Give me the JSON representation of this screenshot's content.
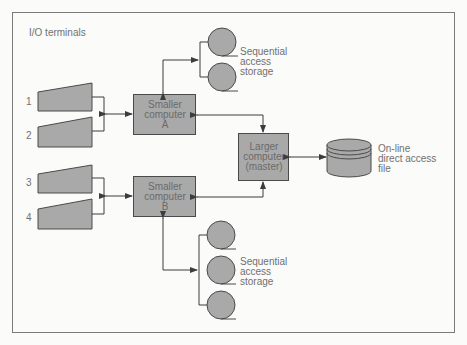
{
  "title": "I/O terminals",
  "terminals": [
    {
      "id": "1",
      "label": "1"
    },
    {
      "id": "2",
      "label": "2"
    },
    {
      "id": "3",
      "label": "3"
    },
    {
      "id": "4",
      "label": "4"
    }
  ],
  "computers": {
    "smaller_a": {
      "label": "Smaller\ncomputer\nA"
    },
    "smaller_b": {
      "label": "Smaller\ncomputer\nB"
    },
    "larger": {
      "label": "Larger\ncomputer\n(master)"
    }
  },
  "storage": {
    "top_sequential": {
      "label": "Sequential\naccess\nstorage",
      "reel_count": 2
    },
    "bottom_sequential": {
      "label": "Sequential\naccess\nstorage",
      "reel_count": 3
    },
    "direct_access": {
      "label": "On-line\ndirect access\nfile"
    }
  },
  "colors": {
    "fill": "#a9a9a9",
    "stroke": "#4a4a4a",
    "line": "#3c3c3c",
    "border": "#7a7a7a",
    "background": "#fbfbf9"
  }
}
